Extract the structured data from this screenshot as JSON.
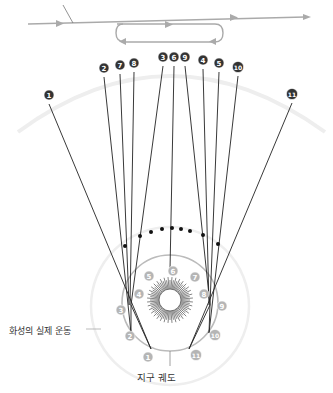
{
  "labels": {
    "mars_motion": "화성의 실제 운동",
    "earth_orbit": "지구 궤도"
  },
  "colors": {
    "line": "#222222",
    "badge_dark": "#333333",
    "badge_light": "#b5b5b5",
    "orbit": "#bbbbbb",
    "outer_arc": "#eeeeee",
    "arrow": "#aaaaaa"
  },
  "sky_badges": [
    {
      "n": "1",
      "x": 49,
      "y": 95
    },
    {
      "n": "2",
      "x": 104,
      "y": 68
    },
    {
      "n": "7",
      "x": 120,
      "y": 65
    },
    {
      "n": "8",
      "x": 134,
      "y": 63
    },
    {
      "n": "3",
      "x": 163,
      "y": 57
    },
    {
      "n": "6",
      "x": 174,
      "y": 57
    },
    {
      "n": "9",
      "x": 185,
      "y": 57
    },
    {
      "n": "4",
      "x": 203,
      "y": 60
    },
    {
      "n": "5",
      "x": 219,
      "y": 63
    },
    {
      "n": "10",
      "x": 238,
      "y": 67
    },
    {
      "n": "11",
      "x": 292,
      "y": 94
    }
  ],
  "earth_badges": [
    {
      "n": "1",
      "x": 148,
      "y": 357
    },
    {
      "n": "2",
      "x": 130,
      "y": 336
    },
    {
      "n": "3",
      "x": 121,
      "y": 310
    },
    {
      "n": "4",
      "x": 139,
      "y": 294
    },
    {
      "n": "5",
      "x": 149,
      "y": 276
    },
    {
      "n": "6",
      "x": 173,
      "y": 271
    },
    {
      "n": "7",
      "x": 195,
      "y": 277
    },
    {
      "n": "8",
      "x": 204,
      "y": 294
    },
    {
      "n": "9",
      "x": 222,
      "y": 306
    },
    {
      "n": "10",
      "x": 215,
      "y": 335
    },
    {
      "n": "11",
      "x": 196,
      "y": 355
    }
  ]
}
